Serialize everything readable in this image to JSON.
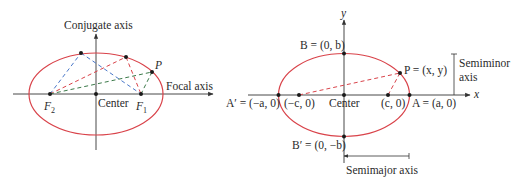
{
  "colors": {
    "ellipse": "#d9434a",
    "axis": "#333333",
    "blue_dash": "#4a78c9",
    "red_dash": "#d9434a",
    "green_dash": "#3c7a4a",
    "point": "#1a1a1a"
  },
  "left_diagram": {
    "conjugate_axis_label": "Conjugate axis",
    "focal_axis_label": "Focal axis",
    "center_label": "Center",
    "focus_left": {
      "letter": "F",
      "subscript": "2"
    },
    "focus_right": {
      "letter": "F",
      "subscript": "1"
    },
    "point_label": "P"
  },
  "right_diagram": {
    "y_axis_label": "y",
    "x_axis_label": "x",
    "B_label": "B = (0, b)",
    "B_prime_label": "B′ = (0, −b)",
    "A_label": "A = (a, 0)",
    "A_prime_label": "A′ = (−a, 0)",
    "neg_c_label": "(−c, 0)",
    "c_label": "(c, 0)",
    "center_label": "Center",
    "P_label": "P = (x, y)",
    "semiminor_line1": "Semiminor",
    "semiminor_line2": "axis",
    "semimajor_label": "Semimajor axis"
  }
}
